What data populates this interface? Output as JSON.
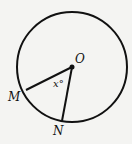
{
  "diagram": {
    "type": "circle-central-angle",
    "center": {
      "label": "O",
      "x": 72,
      "y": 67
    },
    "radius": 55,
    "points": [
      {
        "label": "M",
        "x": 26,
        "y": 90
      },
      {
        "label": "N",
        "x": 62,
        "y": 121
      }
    ],
    "angle_label": "x°",
    "stroke_color": "#111111",
    "background": "#f4f4f2"
  },
  "labels": {
    "O": "O",
    "M": "M",
    "N": "N",
    "angle": "x°"
  }
}
